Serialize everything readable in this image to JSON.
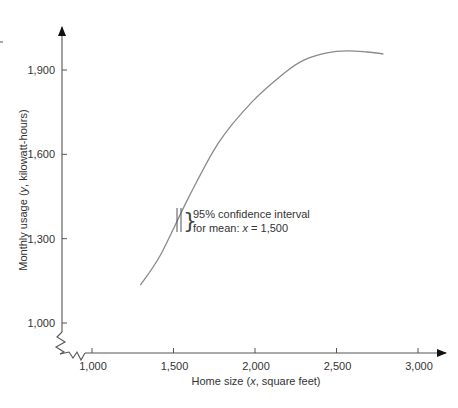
{
  "chart_data": {
    "type": "line",
    "title": "",
    "xlabel": "Home size (x, square feet)",
    "ylabel": "Monthly usage (y, kilowatt-hours)",
    "xlabel_parts": {
      "pre": "Home size (",
      "var": "x",
      "post": ", square feet)"
    },
    "ylabel_parts": {
      "pre": "Monthly usage (",
      "var": "y",
      "post": ", kilowatt-hours)"
    },
    "x_ticks": [
      1000,
      1500,
      2000,
      2500,
      3000
    ],
    "x_tick_labels": [
      "1,000",
      "1,500",
      "2,000",
      "2,500",
      "3,000"
    ],
    "y_ticks": [
      1000,
      1300,
      1600,
      1900
    ],
    "y_tick_labels": [
      "1,000",
      "1,300",
      "1,600",
      "1,900"
    ],
    "xlim": [
      1000,
      3000
    ],
    "ylim": [
      1000,
      1900
    ],
    "axis_breaks": true,
    "grid": false,
    "legend": null,
    "series": [
      {
        "name": "curve",
        "x": [
          1297,
          1420,
          1594,
          1776,
          1976,
          2182,
          2303,
          2442,
          2564,
          2685,
          2788
        ],
        "y": [
          1135,
          1242,
          1448,
          1641,
          1783,
          1890,
          1936,
          1961,
          1968,
          1964,
          1957
        ]
      }
    ],
    "annotations": [
      {
        "text_line1": "95% confidence interval",
        "text_line2_pre": "for mean: ",
        "text_line2_var": "x",
        "text_line2_post": " = 1,500",
        "at_x": 1500
      }
    ]
  }
}
